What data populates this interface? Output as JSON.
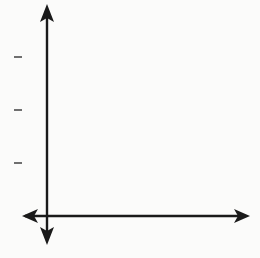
{
  "chart_data": {
    "type": "scatter",
    "title": "",
    "xlabel": "x",
    "ylabel": "y",
    "x_ticks": [
      2,
      4,
      6
    ],
    "y_ticks": [
      2,
      4,
      6
    ],
    "xlim": [
      -1,
      8
    ],
    "ylim": [
      -1,
      8
    ],
    "grid": true,
    "legend": null,
    "points": [
      {
        "x": 0,
        "y": 5
      },
      {
        "x": 1,
        "y": 4.5
      },
      {
        "x": 2,
        "y": 4
      },
      {
        "x": 3,
        "y": 3.5
      },
      {
        "x": 4,
        "y": 3
      },
      {
        "x": 5,
        "y": 2.5
      },
      {
        "x": 6,
        "y": 2
      }
    ]
  },
  "labels": {
    "x_axis": "x",
    "y_axis": "y",
    "x_tick_2": "2",
    "x_tick_4": "4",
    "x_tick_6": "6",
    "y_tick_2": "2",
    "y_tick_4": "4",
    "y_tick_6": "6"
  },
  "colors": {
    "grid": "#6f6f6f",
    "axis": "#1a1a1a",
    "point": "#111111"
  }
}
